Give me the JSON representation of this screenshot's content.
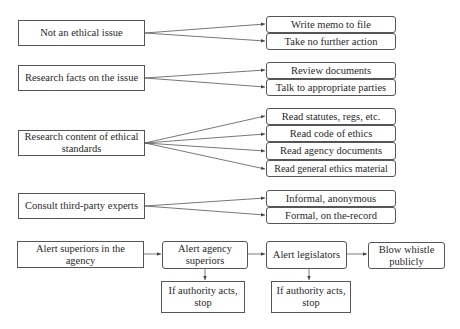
{
  "diagram": {
    "sources": [
      {
        "label": "Not an ethical issue"
      },
      {
        "label": "Research facts on the issue"
      },
      {
        "label": "Research content of ethical standards"
      },
      {
        "label": "Consult third-party experts"
      }
    ],
    "actions": {
      "not_ethical": [
        "Write memo to file",
        "Take no further action"
      ],
      "research_facts": [
        "Review documents",
        "Talk to appropriate parties"
      ],
      "research_standards": [
        "Read statutes, regs, etc.",
        "Read code of ethics",
        "Read agency documents",
        "Read general ethics material"
      ],
      "consult_experts": [
        "Informal, anonymous",
        "Formal, on the-record"
      ]
    },
    "escalation": {
      "start": "Alert superiors in the agency",
      "step1": "Alert agency superiors",
      "step1_stop": "If authority acts, stop",
      "step2": "Alert legislators",
      "step2_stop": "If authority acts, stop",
      "final": "Blow whistle publicly"
    },
    "colors": {
      "stroke": "#555555",
      "text": "#2a2a2a",
      "background": "#ffffff"
    }
  }
}
